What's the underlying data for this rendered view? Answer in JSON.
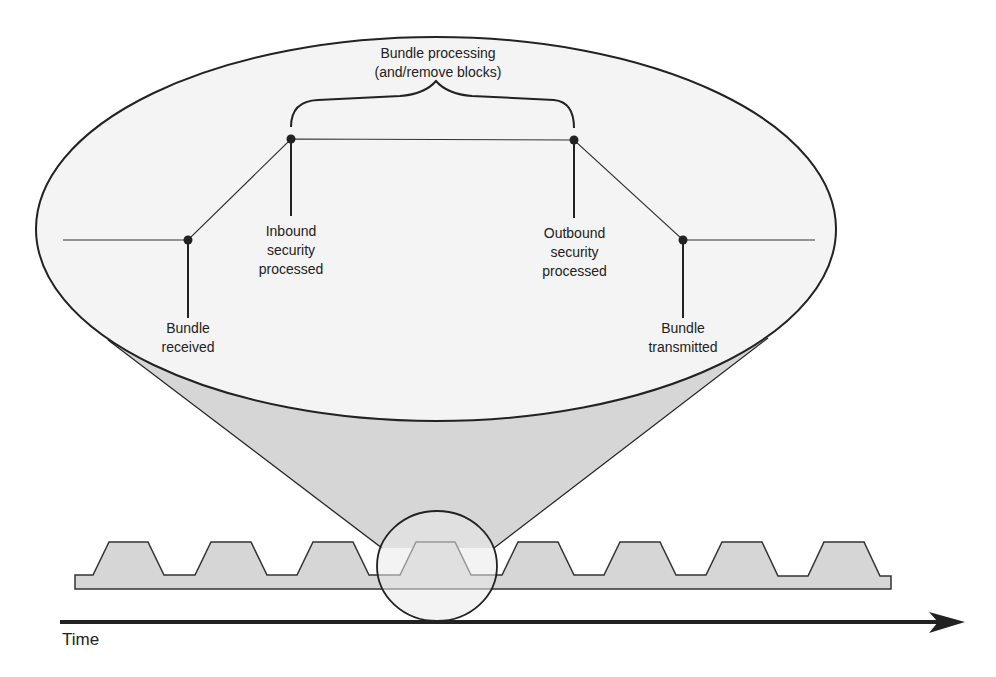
{
  "diagram": {
    "title_label": "Bundle processing\n(and/remove blocks)",
    "events": [
      {
        "id": "bundle-received",
        "label": "Bundle\nreceived"
      },
      {
        "id": "inbound-security",
        "label": "Inbound\nsecurity\nprocessed"
      },
      {
        "id": "outbound-security",
        "label": "Outbound\nsecurity\nprocessed"
      },
      {
        "id": "bundle-transmitted",
        "label": "Bundle\ntransmitted"
      }
    ],
    "axis": {
      "label": "Time"
    },
    "colors": {
      "stroke": "#222222",
      "fill_gray": "#d6d6d6",
      "fill_light": "#f2f2f2"
    }
  }
}
